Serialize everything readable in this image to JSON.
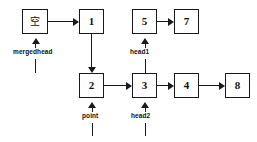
{
  "diagram": {
    "background_color": "#ffffff",
    "stroke_color": "#1a1a1a",
    "text_color": "#111111",
    "nodes": [
      {
        "id": "merged_null",
        "value": "空",
        "x": 22,
        "y": 9,
        "w": 26,
        "h": 25,
        "row": "top"
      },
      {
        "id": "n1",
        "value": "1",
        "x": 79,
        "y": 9,
        "w": 25,
        "h": 25,
        "row": "top"
      },
      {
        "id": "n5",
        "value": "5",
        "x": 132,
        "y": 9,
        "w": 25,
        "h": 25,
        "row": "top"
      },
      {
        "id": "n7",
        "value": "7",
        "x": 174,
        "y": 9,
        "w": 25,
        "h": 25,
        "row": "top"
      },
      {
        "id": "n2",
        "value": "2",
        "x": 79,
        "y": 73,
        "w": 25,
        "h": 25,
        "row": "bottom"
      },
      {
        "id": "n3",
        "value": "3",
        "x": 132,
        "y": 73,
        "w": 25,
        "h": 25,
        "row": "bottom"
      },
      {
        "id": "n4",
        "value": "4",
        "x": 174,
        "y": 73,
        "w": 25,
        "h": 25,
        "row": "bottom"
      },
      {
        "id": "n8",
        "value": "8",
        "x": 225,
        "y": 73,
        "w": 25,
        "h": 25,
        "row": "bottom"
      }
    ],
    "pointer_labels": [
      {
        "id": "mergedhead",
        "text": "mergedhead",
        "x": 13,
        "y": 49,
        "target_node": "merged_null"
      },
      {
        "id": "head1",
        "text": "head1",
        "x": 130,
        "y": 49,
        "target_node": "n5"
      },
      {
        "id": "point",
        "text": "point",
        "x": 82,
        "y": 113,
        "target_node": "n2"
      },
      {
        "id": "head2",
        "text": "head2",
        "x": 131,
        "y": 113,
        "target_node": "n3"
      }
    ],
    "edges": [
      {
        "from": "merged_null",
        "to": "n1",
        "direction": "right"
      },
      {
        "from": "n1",
        "to": "n2",
        "direction": "down"
      },
      {
        "from": "n5",
        "to": "n7",
        "direction": "right"
      },
      {
        "from": "n2",
        "to": "n3",
        "direction": "right"
      },
      {
        "from": "n3",
        "to": "n4",
        "direction": "right"
      },
      {
        "from": "n4",
        "to": "n8",
        "direction": "right"
      }
    ]
  }
}
